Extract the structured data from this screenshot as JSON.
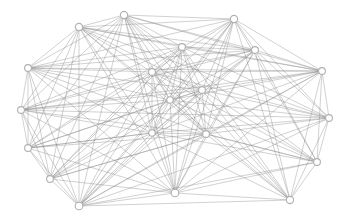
{
  "figure": {
    "kind": "network-graph",
    "title": "",
    "background_color": "#ffffff",
    "width": 351,
    "height": 221
  },
  "graph_style": {
    "edge_color": "#808080",
    "edge_width": 0.5,
    "edge_opacity": 0.72,
    "node_fill": "#ffffff",
    "node_stroke": "#b0b0b0",
    "node_stroke_width": 1.1,
    "node_radius": 3.4
  },
  "graph_data": {
    "type": "node-link-diagram",
    "layout": "force-directed",
    "directed": false,
    "node_count": 20,
    "edge_count": 153,
    "nodes": [
      {
        "id": 0,
        "x": 124,
        "y": 15,
        "r": 3.6
      },
      {
        "id": 1,
        "x": 79,
        "y": 27,
        "r": 3.6
      },
      {
        "id": 2,
        "x": 234,
        "y": 19,
        "r": 3.6
      },
      {
        "id": 3,
        "x": 255,
        "y": 50,
        "r": 3.4
      },
      {
        "id": 4,
        "x": 182,
        "y": 47,
        "r": 3.4
      },
      {
        "id": 5,
        "x": 28,
        "y": 68,
        "r": 3.4
      },
      {
        "id": 6,
        "x": 322,
        "y": 71,
        "r": 3.4
      },
      {
        "id": 7,
        "x": 152,
        "y": 72,
        "r": 3.4
      },
      {
        "id": 8,
        "x": 202,
        "y": 90,
        "r": 3.4
      },
      {
        "id": 9,
        "x": 21,
        "y": 110,
        "r": 3.4
      },
      {
        "id": 10,
        "x": 329,
        "y": 118,
        "r": 3.4
      },
      {
        "id": 11,
        "x": 170,
        "y": 100,
        "r": 3.2
      },
      {
        "id": 12,
        "x": 152,
        "y": 133,
        "r": 3.2
      },
      {
        "id": 13,
        "x": 206,
        "y": 134,
        "r": 3.4
      },
      {
        "id": 14,
        "x": 28,
        "y": 148,
        "r": 3.4
      },
      {
        "id": 15,
        "x": 317,
        "y": 162,
        "r": 3.4
      },
      {
        "id": 16,
        "x": 50,
        "y": 179,
        "r": 3.4
      },
      {
        "id": 17,
        "x": 175,
        "y": 193,
        "r": 3.8
      },
      {
        "id": 18,
        "x": 290,
        "y": 200,
        "r": 3.6
      },
      {
        "id": 19,
        "x": 79,
        "y": 206,
        "r": 3.8
      }
    ],
    "edges": [
      [
        0,
        1
      ],
      [
        0,
        2
      ],
      [
        0,
        3
      ],
      [
        0,
        4
      ],
      [
        0,
        5
      ],
      [
        0,
        6
      ],
      [
        0,
        7
      ],
      [
        0,
        8
      ],
      [
        0,
        9
      ],
      [
        0,
        11
      ],
      [
        0,
        12
      ],
      [
        0,
        13
      ],
      [
        0,
        14
      ],
      [
        0,
        16
      ],
      [
        0,
        17
      ],
      [
        0,
        19
      ],
      [
        0,
        18
      ],
      [
        0,
        15
      ],
      [
        1,
        2
      ],
      [
        1,
        3
      ],
      [
        1,
        4
      ],
      [
        1,
        5
      ],
      [
        1,
        7
      ],
      [
        1,
        8
      ],
      [
        1,
        9
      ],
      [
        1,
        11
      ],
      [
        1,
        12
      ],
      [
        1,
        13
      ],
      [
        1,
        14
      ],
      [
        1,
        16
      ],
      [
        1,
        17
      ],
      [
        1,
        19
      ],
      [
        1,
        10
      ],
      [
        1,
        6
      ],
      [
        2,
        3
      ],
      [
        2,
        4
      ],
      [
        2,
        6
      ],
      [
        2,
        7
      ],
      [
        2,
        8
      ],
      [
        2,
        10
      ],
      [
        2,
        11
      ],
      [
        2,
        12
      ],
      [
        2,
        13
      ],
      [
        2,
        15
      ],
      [
        2,
        17
      ],
      [
        2,
        18
      ],
      [
        2,
        19
      ],
      [
        2,
        5
      ],
      [
        2,
        16
      ],
      [
        3,
        4
      ],
      [
        3,
        6
      ],
      [
        3,
        7
      ],
      [
        3,
        8
      ],
      [
        3,
        10
      ],
      [
        3,
        11
      ],
      [
        3,
        12
      ],
      [
        3,
        13
      ],
      [
        3,
        15
      ],
      [
        3,
        17
      ],
      [
        3,
        18
      ],
      [
        3,
        5
      ],
      [
        3,
        9
      ],
      [
        3,
        19
      ],
      [
        4,
        5
      ],
      [
        4,
        6
      ],
      [
        4,
        7
      ],
      [
        4,
        8
      ],
      [
        4,
        9
      ],
      [
        4,
        11
      ],
      [
        4,
        12
      ],
      [
        4,
        13
      ],
      [
        4,
        14
      ],
      [
        4,
        16
      ],
      [
        4,
        17
      ],
      [
        4,
        19
      ],
      [
        4,
        10
      ],
      [
        4,
        18
      ],
      [
        5,
        7
      ],
      [
        5,
        8
      ],
      [
        5,
        9
      ],
      [
        5,
        11
      ],
      [
        5,
        12
      ],
      [
        5,
        13
      ],
      [
        5,
        14
      ],
      [
        5,
        16
      ],
      [
        5,
        17
      ],
      [
        5,
        19
      ],
      [
        5,
        6
      ],
      [
        6,
        8
      ],
      [
        6,
        10
      ],
      [
        6,
        11
      ],
      [
        6,
        13
      ],
      [
        6,
        15
      ],
      [
        6,
        17
      ],
      [
        6,
        18
      ],
      [
        6,
        12
      ],
      [
        6,
        7
      ],
      [
        6,
        19
      ],
      [
        6,
        9
      ],
      [
        7,
        8
      ],
      [
        7,
        9
      ],
      [
        7,
        11
      ],
      [
        7,
        12
      ],
      [
        7,
        13
      ],
      [
        7,
        14
      ],
      [
        7,
        16
      ],
      [
        7,
        17
      ],
      [
        7,
        19
      ],
      [
        7,
        10
      ],
      [
        7,
        15
      ],
      [
        7,
        18
      ],
      [
        8,
        9
      ],
      [
        8,
        10
      ],
      [
        8,
        11
      ],
      [
        8,
        12
      ],
      [
        8,
        13
      ],
      [
        8,
        14
      ],
      [
        8,
        15
      ],
      [
        8,
        16
      ],
      [
        8,
        17
      ],
      [
        8,
        18
      ],
      [
        8,
        19
      ],
      [
        9,
        11
      ],
      [
        9,
        12
      ],
      [
        9,
        13
      ],
      [
        9,
        14
      ],
      [
        9,
        16
      ],
      [
        9,
        17
      ],
      [
        9,
        19
      ],
      [
        9,
        10
      ],
      [
        10,
        11
      ],
      [
        10,
        13
      ],
      [
        10,
        15
      ],
      [
        10,
        17
      ],
      [
        10,
        18
      ],
      [
        10,
        12
      ],
      [
        10,
        19
      ],
      [
        11,
        12
      ],
      [
        11,
        13
      ],
      [
        11,
        14
      ],
      [
        11,
        16
      ],
      [
        11,
        17
      ],
      [
        11,
        19
      ],
      [
        11,
        15
      ],
      [
        11,
        18
      ],
      [
        12,
        13
      ],
      [
        12,
        14
      ],
      [
        12,
        16
      ],
      [
        12,
        17
      ],
      [
        12,
        19
      ],
      [
        12,
        15
      ],
      [
        12,
        18
      ],
      [
        13,
        14
      ],
      [
        13,
        15
      ],
      [
        13,
        16
      ],
      [
        13,
        17
      ],
      [
        13,
        18
      ],
      [
        13,
        19
      ],
      [
        14,
        16
      ],
      [
        14,
        17
      ],
      [
        14,
        19
      ],
      [
        14,
        12
      ],
      [
        15,
        17
      ],
      [
        15,
        18
      ],
      [
        15,
        19
      ],
      [
        15,
        13
      ],
      [
        16,
        17
      ],
      [
        16,
        19
      ],
      [
        16,
        13
      ],
      [
        17,
        18
      ],
      [
        17,
        19
      ],
      [
        18,
        19
      ]
    ]
  }
}
